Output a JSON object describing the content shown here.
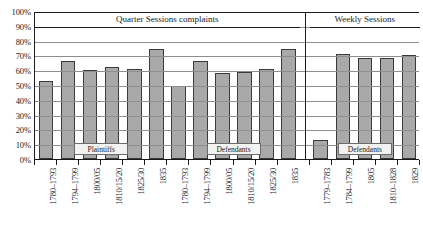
{
  "chart_data": {
    "type": "bar",
    "title": "",
    "xlabel": "",
    "ylabel": "",
    "ylim": [
      0,
      100
    ],
    "grid": true,
    "legend": "none",
    "y_ticks": [
      "0%",
      "10%",
      "20%",
      "30%",
      "40%",
      "50%",
      "60%",
      "70%",
      "80%",
      "90%",
      "100%"
    ],
    "y_tick_values": [
      0,
      10,
      20,
      30,
      40,
      50,
      60,
      70,
      80,
      90,
      100
    ],
    "panels": [
      {
        "title": "Quarter Sessions complaints",
        "groups": [
          {
            "caption": "Plaintiffs",
            "categories": [
              "1780–1793",
              "1794–1799",
              "1800/05",
              "1810/15/20",
              "1825/30",
              "1835"
            ],
            "values": [
              53,
              66,
              60,
              62,
              61,
              74
            ]
          },
          {
            "caption": "Defendants",
            "categories": [
              "1780–1793",
              "1794–1799",
              "1800/05",
              "1810/15/20",
              "1825/30",
              "1835"
            ],
            "values": [
              49,
              66,
              58,
              59,
              61,
              74
            ]
          }
        ]
      },
      {
        "title": "Weekly Sessions",
        "groups": [
          {
            "caption": "Defendants",
            "categories": [
              "1779–1783",
              "1784–1799",
              "1805",
              "1810–1828",
              "1829"
            ],
            "values": [
              13,
              71,
              68,
              68,
              70
            ]
          }
        ]
      }
    ],
    "categories": [
      "1780–1793",
      "1794–1799",
      "1800/05",
      "1810/15/20",
      "1825/30",
      "1835",
      "1780–1793",
      "1794–1799",
      "1800/05",
      "1810/15/20",
      "1825/30",
      "1835",
      "1779–1783",
      "1784–1799",
      "1805",
      "1810–1828",
      "1829"
    ],
    "values": [
      53,
      66,
      60,
      62,
      61,
      74,
      49,
      66,
      58,
      59,
      61,
      74,
      13,
      71,
      68,
      68,
      70
    ],
    "colors": {
      "bar_fill": "#a9a9a9",
      "bar_stroke": "#3a3a3a",
      "gridline": "#8e8e8e",
      "axis": "#1a1a1a",
      "caption_bg": "#f2f2f0"
    }
  }
}
